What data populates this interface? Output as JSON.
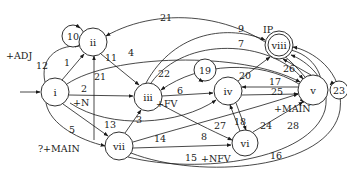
{
  "diagram": {
    "type": "state-transition-graph",
    "nodes": [
      {
        "id": "i",
        "label": "i",
        "x": 55,
        "y": 92,
        "r": 14,
        "start": true
      },
      {
        "id": "ii",
        "label": "ii",
        "x": 93,
        "y": 42,
        "r": 14
      },
      {
        "id": "iii",
        "label": "iii",
        "x": 148,
        "y": 97,
        "r": 14
      },
      {
        "id": "iv",
        "label": "iv",
        "x": 228,
        "y": 91,
        "r": 14
      },
      {
        "id": "v",
        "label": "v",
        "x": 313,
        "y": 90,
        "r": 15
      },
      {
        "id": "vi",
        "label": "vi",
        "x": 245,
        "y": 143,
        "r": 13
      },
      {
        "id": "vii",
        "label": "vii",
        "x": 119,
        "y": 146,
        "r": 14
      },
      {
        "id": "viii",
        "label": "viii",
        "x": 279,
        "y": 45,
        "r": 14,
        "accepting": true
      }
    ],
    "loops": [
      {
        "label": "10",
        "x": 73,
        "y": 36,
        "r": 11
      },
      {
        "label": "19",
        "x": 205,
        "y": 70,
        "r": 11
      },
      {
        "label": "23",
        "x": 339,
        "y": 90,
        "r": 9
      }
    ],
    "edge_labels": [
      {
        "text": "1",
        "x": 67,
        "y": 62
      },
      {
        "text": "2",
        "x": 84,
        "y": 88
      },
      {
        "text": "3",
        "x": 139,
        "y": 119
      },
      {
        "text": "4",
        "x": 131,
        "y": 52
      },
      {
        "text": "5",
        "x": 72,
        "y": 129
      },
      {
        "text": "6",
        "x": 180,
        "y": 90
      },
      {
        "text": "7",
        "x": 241,
        "y": 43
      },
      {
        "text": "8",
        "x": 204,
        "y": 136
      },
      {
        "text": "9",
        "x": 241,
        "y": 28
      },
      {
        "text": "11",
        "x": 111,
        "y": 57
      },
      {
        "text": "12",
        "x": 42,
        "y": 65
      },
      {
        "text": "13",
        "x": 110,
        "y": 124
      },
      {
        "text": "14",
        "x": 160,
        "y": 138
      },
      {
        "text": "15",
        "x": 191,
        "y": 157
      },
      {
        "text": "16",
        "x": 276,
        "y": 155
      },
      {
        "text": "17",
        "x": 275,
        "y": 81
      },
      {
        "text": "18",
        "x": 240,
        "y": 121
      },
      {
        "text": "20",
        "x": 245,
        "y": 75
      },
      {
        "text": "21",
        "x": 166,
        "y": 17
      },
      {
        "text": "21",
        "x": 100,
        "y": 76
      },
      {
        "text": "22",
        "x": 164,
        "y": 73
      },
      {
        "text": "24",
        "x": 266,
        "y": 125
      },
      {
        "text": "25",
        "x": 277,
        "y": 91
      },
      {
        "text": "26",
        "x": 289,
        "y": 68
      },
      {
        "text": "27",
        "x": 220,
        "y": 125
      },
      {
        "text": "28",
        "x": 293,
        "y": 125
      }
    ],
    "annotations": [
      {
        "text": "+ADJ",
        "x": 6,
        "y": 55
      },
      {
        "text": "+N",
        "x": 73,
        "y": 102
      },
      {
        "text": "+FV",
        "x": 156,
        "y": 103
      },
      {
        "text": "+MAIN",
        "x": 274,
        "y": 108
      },
      {
        "text": "+NFV",
        "x": 201,
        "y": 158
      },
      {
        "text": "?+MAIN",
        "x": 38,
        "y": 148
      },
      {
        "text": "IP",
        "x": 263,
        "y": 29
      }
    ]
  }
}
